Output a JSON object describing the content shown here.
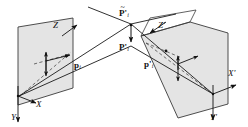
{
  "figure": {
    "type": "3d-geometry-diagram",
    "topic": "stereo projection of a 3D point onto two image planes",
    "background_color": "#ffffff",
    "plane_fill_color": "#e3e3e3",
    "plane_stroke_color": "#333333",
    "line_color": "#1a1a1a",
    "dashed_color": "#555555"
  },
  "labels": {
    "left_axis_x": "X",
    "left_axis_y": "Y",
    "left_axis_z": "Z",
    "right_axis_x": "X'",
    "right_axis_y": "Y'",
    "right_axis_z": "Z'",
    "left_point": "p",
    "left_point_sub": "i",
    "right_point": "p'",
    "right_point_sub": "i",
    "top_point_tilde": "P'",
    "top_point_tilde_sub": "i",
    "top_point_tilde_accent": "~",
    "top_point_plain": "P'",
    "top_point_plain_sub": "i"
  },
  "geometry": {
    "left_plane_corners": [
      [
        18,
        27
      ],
      [
        73,
        18
      ],
      [
        73,
        88
      ],
      [
        18,
        105
      ]
    ],
    "right_plane_corners": [
      [
        140,
        35
      ],
      [
        190,
        22
      ],
      [
        228,
        33
      ],
      [
        228,
        104
      ],
      [
        178,
        118
      ]
    ],
    "left_origin": [
      18,
      97
    ],
    "right_origin": [
      214,
      95
    ],
    "ray_crossing_upper": [
      131,
      23
    ],
    "ray_crossing_lower": [
      131,
      46
    ]
  }
}
